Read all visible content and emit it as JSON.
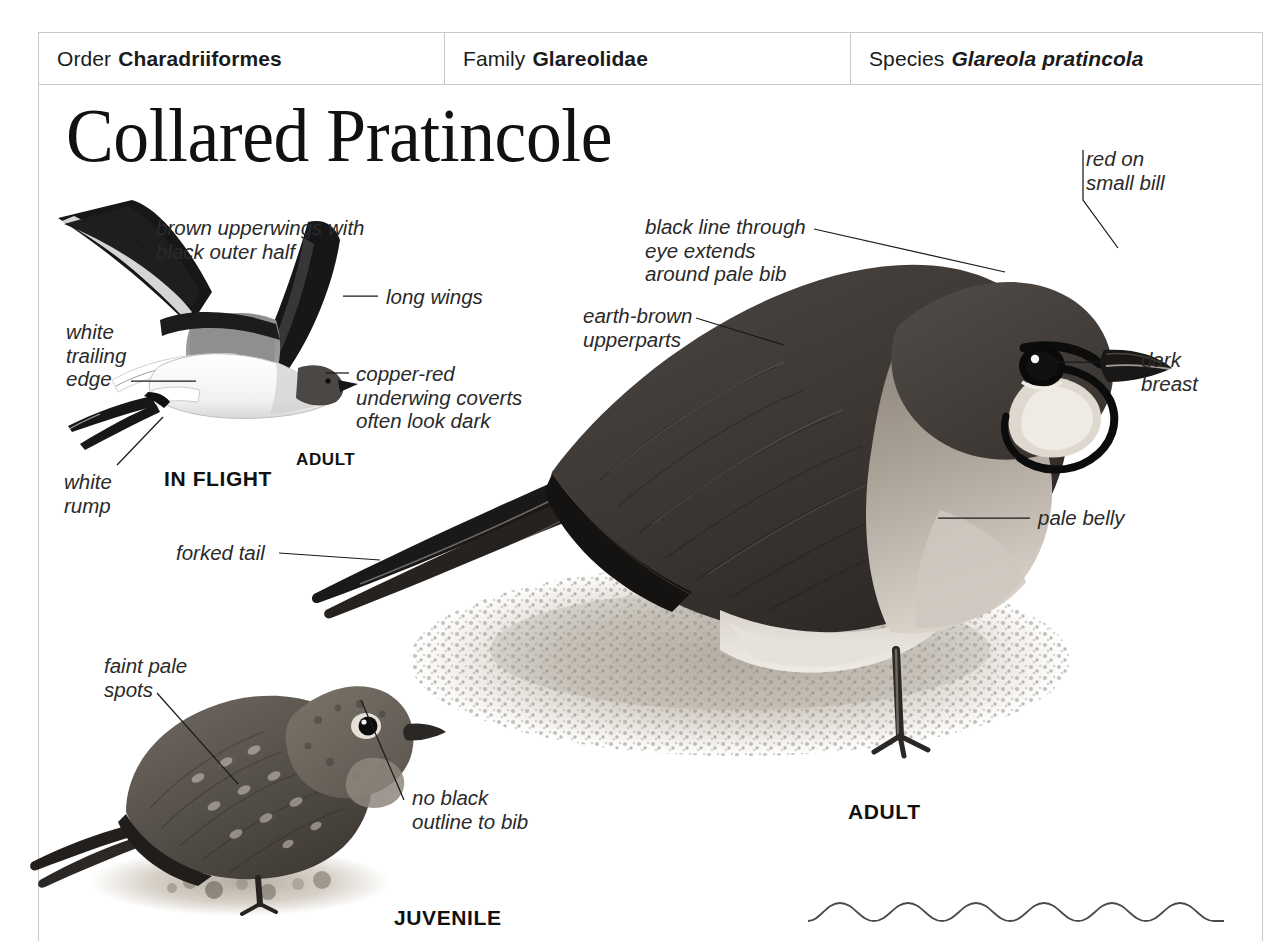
{
  "header": {
    "order": {
      "label": "Order",
      "value": "Charadriiformes"
    },
    "family": {
      "label": "Family",
      "value": "Glareolidae"
    },
    "species": {
      "label": "Species",
      "value": "Glareola pratincola"
    }
  },
  "title": "Collared Pratincole",
  "flight_plate": {
    "caption": "IN FLIGHT",
    "age_caption": "ADULT",
    "labels": {
      "upperwings": "brown upperwings with\nblack outer half",
      "long_wings": "long wings",
      "trailing_edge": "white\ntrailing\nedge",
      "underwing": "copper-red\nunderwing coverts\noften look dark",
      "rump": "white\nrump",
      "tail": "forked tail"
    }
  },
  "adult_plate": {
    "caption": "ADULT",
    "labels": {
      "eye_line": "black line through\neye extends\naround pale bib",
      "upperparts": "earth-brown\nupperparts",
      "bill": "red on\nsmall bill",
      "breast": "dark\nbreast",
      "belly": "pale belly"
    }
  },
  "juvenile_plate": {
    "caption": "JUVENILE",
    "labels": {
      "spots": "faint pale\nspots",
      "bib": "no black\noutline to bib"
    }
  },
  "colors": {
    "rule": "#c9c9c9",
    "text": "#1b1b1b",
    "label_text": "#2a2a2a",
    "leader_line": "#1a1a1a",
    "plumage_dark": "#3b3734",
    "plumage_mid": "#6a635c",
    "plumage_pale": "#d9d4cd",
    "black": "#101010"
  }
}
